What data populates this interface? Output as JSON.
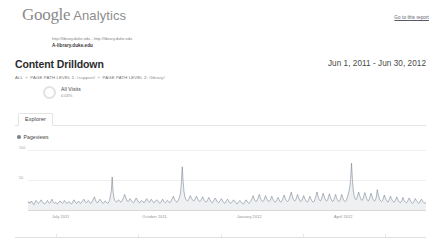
{
  "header": {
    "logo_google": "Google",
    "logo_product": "Analytics",
    "report_link": "Go to this report"
  },
  "property": {
    "urls": "http://library.duke.edu - http://library.duke.edu",
    "name": "A-library.duke.edu"
  },
  "title": {
    "page_title": "Content Drilldown",
    "date_range": "Jun 1, 2011 - Jun 30, 2012"
  },
  "breadcrumb": {
    "root": "ALL",
    "sep": "»",
    "level1_label": "PAGE PATH LEVEL 1:",
    "level1_value": "/support/",
    "level2_label": "PAGE PATH LEVEL 2:",
    "level2_value": "/library/"
  },
  "segment": {
    "label": "All Visits",
    "value": "0.03%",
    "icon": "donut-icon"
  },
  "tabs": [
    {
      "label": "Explorer",
      "active": true
    }
  ],
  "chart_data": {
    "type": "line",
    "title": "Pageviews",
    "legend": [
      "Pageviews"
    ],
    "legend_position": "top-left",
    "legend_color": "#7b8896",
    "xlabel": "",
    "ylabel": "",
    "ylim": [
      0,
      100
    ],
    "yticks": [
      50,
      100
    ],
    "ytick_labels": [
      "50",
      "100"
    ],
    "grid": true,
    "x_tick_labels": [
      "July 2011",
      "October 2011",
      "January 2012",
      "April 2012"
    ],
    "x_tick_positions": [
      0.082,
      0.318,
      0.556,
      0.792
    ],
    "line_color": "#6f7d8c",
    "fill_color": "#eef0f2",
    "x_start": "2011-06-01",
    "x_end": "2012-06-30",
    "values": [
      12,
      14,
      11,
      13,
      15,
      12,
      10,
      9,
      13,
      16,
      14,
      12,
      11,
      13,
      15,
      17,
      14,
      12,
      11,
      10,
      12,
      14,
      16,
      13,
      11,
      12,
      15,
      18,
      14,
      12,
      11,
      13,
      12,
      10,
      11,
      13,
      15,
      14,
      12,
      11,
      13,
      16,
      14,
      12,
      11,
      12,
      14,
      13,
      11,
      10,
      12,
      15,
      17,
      14,
      12,
      11,
      13,
      15,
      13,
      11,
      12,
      14,
      16,
      18,
      15,
      13,
      12,
      14,
      16,
      14,
      12,
      11,
      13,
      16,
      19,
      22,
      17,
      14,
      12,
      13,
      15,
      18,
      16,
      14,
      12,
      11,
      13,
      15,
      14,
      12,
      11,
      13,
      16,
      24,
      32,
      55,
      30,
      20,
      16,
      14,
      13,
      15,
      17,
      16,
      14,
      13,
      15,
      18,
      21,
      26,
      22,
      18,
      15,
      14,
      16,
      19,
      17,
      15,
      13,
      12,
      14,
      17,
      20,
      18,
      15,
      13,
      12,
      14,
      16,
      15,
      13,
      12,
      14,
      17,
      19,
      16,
      14,
      13,
      15,
      18,
      16,
      14,
      12,
      13,
      15,
      17,
      16,
      14,
      12,
      11,
      13,
      16,
      18,
      15,
      13,
      12,
      14,
      16,
      15,
      13,
      12,
      14,
      17,
      20,
      23,
      19,
      16,
      14,
      13,
      15,
      18,
      22,
      28,
      45,
      72,
      48,
      30,
      22,
      18,
      16,
      15,
      17,
      20,
      24,
      21,
      18,
      16,
      15,
      17,
      20,
      23,
      20,
      17,
      15,
      14,
      16,
      19,
      22,
      19,
      16,
      14,
      13,
      15,
      18,
      21,
      18,
      15,
      13,
      12,
      14,
      17,
      20,
      18,
      15,
      13,
      12,
      14,
      16,
      19,
      17,
      14,
      12,
      11,
      13,
      16,
      18,
      16,
      13,
      12,
      11,
      13,
      15,
      17,
      15,
      13,
      11,
      10,
      12,
      14,
      16,
      14,
      12,
      11,
      10,
      12,
      15,
      17,
      15,
      13,
      11,
      12,
      14,
      17,
      20,
      24,
      19,
      16,
      14,
      15,
      18,
      22,
      26,
      21,
      17,
      15,
      14,
      16,
      20,
      24,
      20,
      17,
      15,
      14,
      16,
      19,
      23,
      19,
      16,
      14,
      13,
      15,
      18,
      21,
      18,
      15,
      13,
      14,
      17,
      21,
      25,
      20,
      17,
      15,
      14,
      16,
      20,
      25,
      30,
      24,
      19,
      16,
      15,
      17,
      21,
      26,
      22,
      18,
      15,
      14,
      16,
      20,
      24,
      20,
      17,
      14,
      13,
      15,
      19,
      23,
      19,
      16,
      14,
      13,
      15,
      19,
      24,
      30,
      24,
      19,
      16,
      15,
      18,
      23,
      28,
      23,
      19,
      16,
      15,
      17,
      22,
      27,
      22,
      18,
      15,
      14,
      17,
      21,
      26,
      21,
      17,
      15,
      14,
      16,
      21,
      26,
      21,
      17,
      15,
      14,
      16,
      20,
      25,
      31,
      38,
      52,
      78,
      50,
      32,
      24,
      19,
      17,
      20,
      25,
      30,
      25,
      20,
      17,
      16,
      19,
      24,
      29,
      24,
      19,
      16,
      15,
      18,
      23,
      28,
      23,
      19,
      16,
      15,
      17,
      22,
      34,
      27,
      21,
      17,
      15,
      14,
      16,
      20,
      25,
      21,
      17,
      15,
      13,
      15,
      19,
      23,
      19,
      16,
      14,
      13,
      15,
      18,
      22,
      18,
      15,
      13,
      12,
      14,
      17,
      21,
      17,
      14,
      13,
      12,
      14,
      17,
      20,
      17,
      14,
      12,
      11,
      13,
      16,
      19,
      16,
      14,
      12,
      11,
      13,
      16,
      18,
      15,
      13,
      12,
      11,
      13
    ]
  }
}
